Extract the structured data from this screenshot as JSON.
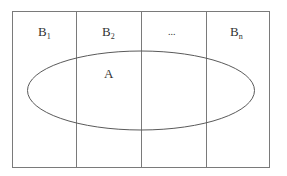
{
  "diagram": {
    "type": "venn-partition",
    "colors": {
      "stroke": "#7a7a7a",
      "ellipse": "#5a5a5a",
      "text": "#333333",
      "background": "#ffffff"
    },
    "partitions": [
      {
        "base": "B",
        "sub": "1"
      },
      {
        "base": "B",
        "sub": "2"
      },
      {
        "base": "",
        "sub": "",
        "text": "..."
      },
      {
        "base": "B",
        "sub": "n"
      }
    ],
    "event": {
      "label": "A"
    }
  }
}
